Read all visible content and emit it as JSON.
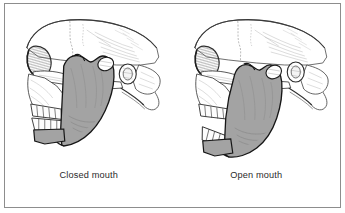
{
  "figure": {
    "border_color": "#8d8d8d",
    "background_color": "#ffffff"
  },
  "colors": {
    "mandible_fill": "#a3a3a3",
    "mandible_stroke": "#1a1a1a",
    "bone_fill": "#ffffff",
    "bone_stroke": "#3a3a3a",
    "hatch_stroke": "#9a9a9a",
    "teeth_fill": "#fcfcfc",
    "caption_text": "#2b2b2b",
    "sinus_shadow": "#707070"
  },
  "panels": [
    {
      "id": "closed-mouth",
      "caption": "Closed mouth",
      "structures": [
        "cranium",
        "zygomatic-arch",
        "maxilla",
        "orbit",
        "upper-teeth",
        "lower-teeth",
        "mandible",
        "mandibular-condyle",
        "coronoid-process",
        "external-auditory-meatus",
        "mastoid-process"
      ]
    },
    {
      "id": "open-mouth",
      "caption": "Open mouth",
      "structures": [
        "cranium",
        "zygomatic-arch",
        "maxilla",
        "orbit",
        "upper-teeth",
        "lower-teeth",
        "mandible",
        "mandibular-condyle",
        "coronoid-process",
        "external-auditory-meatus",
        "mastoid-process"
      ]
    }
  ]
}
